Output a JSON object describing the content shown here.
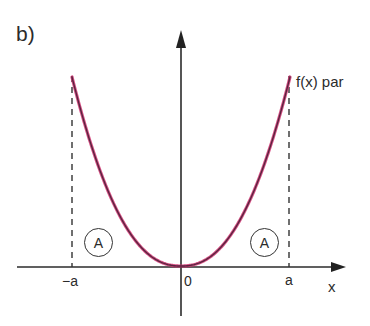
{
  "figure": {
    "panel_label": "b)",
    "function_label": "f(x) par",
    "x_axis": {
      "name": "x",
      "ticks": [
        {
          "label": "−a",
          "value": "-a"
        },
        {
          "label": "0",
          "value": "0"
        },
        {
          "label": "a",
          "value": "a"
        }
      ]
    },
    "regions": [
      {
        "label": "A",
        "side": "left"
      },
      {
        "label": "A",
        "side": "right"
      }
    ],
    "colors": {
      "curve": "#5a2540",
      "curve_glow": "#d0306e",
      "axis": "#2b2b2b",
      "dashed": "#333333"
    }
  }
}
